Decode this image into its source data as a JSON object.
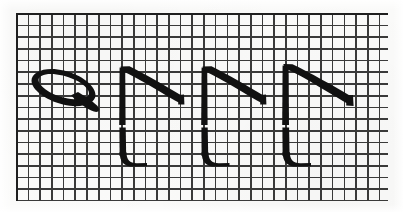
{
  "page": {
    "width": 403,
    "height": 212,
    "caption": ""
  },
  "colors": {
    "paper": "#fbfbfa",
    "grid_line": "#2a2a2a",
    "grid_frame": "#1f1f1f",
    "ink": "#111111"
  },
  "grid": {
    "name": "graph-paper-grid",
    "left": 16,
    "top": 13,
    "width": 372,
    "height": 188,
    "cell_size_px": 11.7,
    "line_width_px": 1.6,
    "columns": 32,
    "rows": 16
  },
  "figures": [
    {
      "id": "figure-1",
      "name": "slanted-loop-glyph",
      "type": "loop",
      "label": "Slanted narrow ellipse with tail",
      "order": 1,
      "bbox": [
        30,
        63,
        100,
        112
      ],
      "stroke_count": 1
    },
    {
      "id": "figure-2",
      "name": "stem-slash-glyph",
      "type": "stem-with-diagonal",
      "label": "Upright stem, top diagonal, bottom foot",
      "order": 2,
      "bbox": [
        118,
        66,
        203,
        166
      ],
      "stroke_count": 2
    },
    {
      "id": "figure-3",
      "name": "stem-slash-glyph",
      "type": "stem-with-diagonal",
      "label": "Upright stem, top diagonal, bottom foot",
      "order": 3,
      "bbox": [
        200,
        66,
        286,
        166
      ],
      "stroke_count": 2
    },
    {
      "id": "figure-4",
      "name": "stem-slash-glyph",
      "type": "stem-with-diagonal",
      "label": "Upright stem, top diagonal, bottom foot",
      "order": 4,
      "bbox": [
        281,
        63,
        360,
        166
      ],
      "stroke_count": 2
    }
  ]
}
